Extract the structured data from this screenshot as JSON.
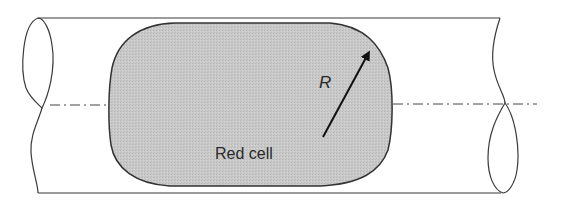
{
  "diagram": {
    "labels": {
      "cell": "Red cell",
      "radius": "R"
    },
    "colors": {
      "cell_fill": "#c8c8c8",
      "outline": "#333333",
      "tube_line": "#3a3a3a",
      "background": "#ffffff"
    },
    "elements": [
      {
        "type": "tube",
        "description": "cylindrical vessel with cut ends"
      },
      {
        "type": "centerline",
        "style": "dash-dot"
      },
      {
        "type": "cell",
        "shape": "rounded capsule"
      },
      {
        "type": "arrow",
        "meaning": "corner radius R"
      }
    ]
  }
}
